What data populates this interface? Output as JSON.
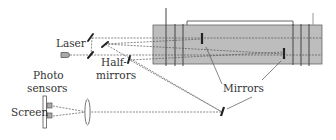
{
  "diagram": {
    "type": "optical-setup",
    "labels": {
      "laser": "Laser",
      "half_mirrors_line1": "Half-",
      "half_mirrors_line2": "mirrors",
      "mirrors": "Mirrors",
      "photo_sensors_line1": "Photo",
      "photo_sensors_line2": "sensors",
      "screen": "Screen"
    },
    "colors": {
      "chamber_fill": "#bdbdbd",
      "line": "#444444",
      "mirror": "#222222",
      "beam": "#555555",
      "text": "#333333"
    }
  }
}
